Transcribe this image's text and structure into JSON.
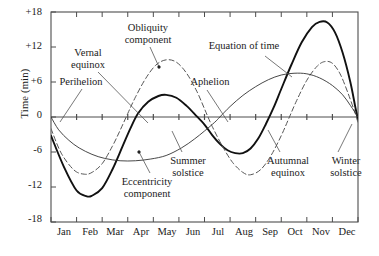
{
  "chart_data": {
    "type": "line",
    "title": "",
    "xlabel": "",
    "ylabel": "Time (min)",
    "ylim": [
      -18,
      18
    ],
    "yticks": [
      18,
      12,
      6,
      0,
      -6,
      -12,
      -18
    ],
    "ytick_labels": [
      "+18",
      "+12",
      "+6",
      "0",
      "-6",
      "-12",
      "-18"
    ],
    "grid": false,
    "legend": "inline annotations",
    "x_categories": [
      "Jan",
      "Feb",
      "Mar",
      "Apr",
      "May",
      "Jun",
      "Jul",
      "Aug",
      "Sep",
      "Oct",
      "Nov",
      "Dec"
    ],
    "x_axis_note": "ticks at month boundaries, labels centered in month",
    "series": [
      {
        "name": "Equation of time",
        "style": "thick-solid",
        "color": "#111111",
        "points": [
          [
            0,
            -3.2
          ],
          [
            0.5,
            -8.5
          ],
          [
            1.0,
            -12.6
          ],
          [
            1.4,
            -13.6
          ],
          [
            1.6,
            -13.5
          ],
          [
            2.0,
            -12.2
          ],
          [
            2.4,
            -9.0
          ],
          [
            2.8,
            -5.0
          ],
          [
            3.1,
            -2.0
          ],
          [
            3.4,
            0.6
          ],
          [
            3.8,
            2.6
          ],
          [
            4.2,
            3.6
          ],
          [
            4.5,
            3.8
          ],
          [
            4.9,
            3.3
          ],
          [
            5.3,
            1.9
          ],
          [
            5.7,
            0.1
          ],
          [
            6.0,
            -1.3
          ],
          [
            6.3,
            -3.1
          ],
          [
            6.6,
            -4.6
          ],
          [
            6.9,
            -5.7
          ],
          [
            7.2,
            -6.2
          ],
          [
            7.5,
            -6.2
          ],
          [
            7.8,
            -5.4
          ],
          [
            8.1,
            -3.7
          ],
          [
            8.4,
            -1.2
          ],
          [
            8.7,
            1.6
          ],
          [
            9.0,
            4.8
          ],
          [
            9.4,
            9.0
          ],
          [
            9.8,
            12.8
          ],
          [
            10.2,
            15.4
          ],
          [
            10.5,
            16.3
          ],
          [
            10.8,
            16.2
          ],
          [
            11.1,
            14.5
          ],
          [
            11.4,
            11.0
          ],
          [
            11.7,
            6.0
          ],
          [
            11.9,
            1.6
          ],
          [
            12.0,
            -0.5
          ]
        ]
      },
      {
        "name": "Obliquity component",
        "style": "thin-dashed",
        "color": "#555555",
        "points": [
          [
            0,
            -2.0
          ],
          [
            0.4,
            -6.2
          ],
          [
            0.9,
            -9.1
          ],
          [
            1.3,
            -9.8
          ],
          [
            1.6,
            -9.5
          ],
          [
            2.0,
            -8.0
          ],
          [
            2.4,
            -5.0
          ],
          [
            2.7,
            -2.3
          ],
          [
            3.0,
            0.6
          ],
          [
            3.3,
            3.4
          ],
          [
            3.7,
            6.6
          ],
          [
            4.1,
            8.9
          ],
          [
            4.5,
            9.8
          ],
          [
            4.9,
            9.4
          ],
          [
            5.3,
            7.5
          ],
          [
            5.7,
            4.4
          ],
          [
            6.0,
            1.4
          ],
          [
            6.3,
            -1.6
          ],
          [
            6.7,
            -5.0
          ],
          [
            7.1,
            -7.8
          ],
          [
            7.5,
            -9.5
          ],
          [
            7.8,
            -9.9
          ],
          [
            8.2,
            -9.0
          ],
          [
            8.6,
            -6.6
          ],
          [
            9.0,
            -3.2
          ],
          [
            9.3,
            -0.2
          ],
          [
            9.6,
            2.8
          ],
          [
            10.0,
            6.3
          ],
          [
            10.4,
            8.7
          ],
          [
            10.7,
            9.5
          ],
          [
            11.0,
            9.2
          ],
          [
            11.3,
            7.4
          ],
          [
            11.6,
            4.2
          ],
          [
            11.9,
            0.5
          ],
          [
            12.0,
            -1.0
          ]
        ]
      },
      {
        "name": "Eccentricity component",
        "style": "thin-solid",
        "color": "#333333",
        "points": [
          [
            0,
            0.0
          ],
          [
            0.3,
            -2.2
          ],
          [
            0.7,
            -4.0
          ],
          [
            1.1,
            -5.3
          ],
          [
            1.6,
            -6.4
          ],
          [
            2.1,
            -7.1
          ],
          [
            2.7,
            -7.5
          ],
          [
            3.3,
            -7.5
          ],
          [
            3.9,
            -7.2
          ],
          [
            4.5,
            -6.6
          ],
          [
            5.1,
            -5.3
          ],
          [
            5.6,
            -3.8
          ],
          [
            6.0,
            -2.4
          ],
          [
            6.4,
            -0.9
          ],
          [
            6.6,
            0.0
          ],
          [
            7.0,
            1.8
          ],
          [
            7.5,
            3.7
          ],
          [
            8.0,
            5.2
          ],
          [
            8.5,
            6.4
          ],
          [
            9.0,
            7.2
          ],
          [
            9.5,
            7.5
          ],
          [
            10.0,
            7.4
          ],
          [
            10.5,
            6.7
          ],
          [
            11.0,
            5.4
          ],
          [
            11.4,
            3.8
          ],
          [
            11.7,
            2.0
          ],
          [
            12.0,
            0.0
          ]
        ]
      }
    ],
    "annotations": [
      {
        "label": "Obliquity\ncomponent",
        "text_line1": "Obliquity",
        "text_line2": "component",
        "target_series": "Obliquity component"
      },
      {
        "label": "Equation of time",
        "text_line1": "Equation of time",
        "text_line2": "",
        "target_series": "Equation of time"
      },
      {
        "label": "Vernal\nequinox",
        "text_line1": "Vernal",
        "text_line2": "equinox",
        "target_event": "vernal equinox"
      },
      {
        "label": "Perihelion",
        "text_line1": "Perihelion",
        "text_line2": "",
        "target_event": "perihelion"
      },
      {
        "label": "Aphelion",
        "text_line1": "Aphelion",
        "text_line2": "",
        "target_event": "aphelion"
      },
      {
        "label": "Eccentricity\ncomponent",
        "text_line1": "Eccentricity",
        "text_line2": "component",
        "target_series": "Eccentricity component"
      },
      {
        "label": "Summer\nsolstice",
        "text_line1": "Summer",
        "text_line2": "solstice",
        "target_event": "summer solstice"
      },
      {
        "label": "Autumnal\nequinox",
        "text_line1": "Autumnal",
        "text_line2": "equinox",
        "target_event": "autumnal equinox"
      },
      {
        "label": "Winter\nsolstice",
        "text_line1": "Winter",
        "text_line2": "solstice",
        "target_event": "winter solstice"
      }
    ]
  },
  "axis": {
    "ylabel": "Time (min)",
    "ytick_labels": [
      "+18",
      "+12",
      "+6",
      "0",
      "-6",
      "-12",
      "-18"
    ],
    "xtick_labels": [
      "Jan",
      "Feb",
      "Mar",
      "Apr",
      "May",
      "Jun",
      "Jul",
      "Aug",
      "Sep",
      "Oct",
      "Nov",
      "Dec"
    ]
  },
  "annotations": {
    "obliquity_l1": "Obliquity",
    "obliquity_l2": "component",
    "equation_of_time": "Equation of time",
    "vernal_l1": "Vernal",
    "vernal_l2": "equinox",
    "perihelion": "Perihelion",
    "aphelion": "Aphelion",
    "eccentricity_l1": "Eccentricity",
    "eccentricity_l2": "component",
    "summer_l1": "Summer",
    "summer_l2": "solstice",
    "autumnal_l1": "Autumnal",
    "autumnal_l2": "equinox",
    "winter_l1": "Winter",
    "winter_l2": "solstice"
  },
  "colors": {
    "frame": "#4d4d4d",
    "thick_curve": "#111111",
    "dashed_curve": "#555555",
    "thin_curve": "#333333",
    "text": "#1a1a1a"
  }
}
